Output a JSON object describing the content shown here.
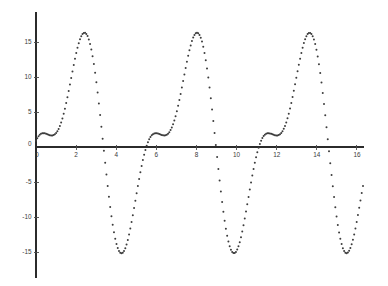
{
  "figure": {
    "title": "",
    "background_color": "#ffffff",
    "axis_color": "#2b2b2b",
    "marker_color": "#3c3c3c",
    "marker_style": "dot",
    "marker_size_px": 1.0
  },
  "geometry": {
    "origin_x_px": 36,
    "origin_y_px": 147,
    "px_per_x_unit": 20.06,
    "px_per_y_unit": 7.0,
    "x_axis_left_px": 36,
    "x_axis_right_px": 364,
    "y_axis_top_px": 12,
    "y_axis_bottom_px": 278
  },
  "chart_data": {
    "type": "scatter",
    "title": "",
    "xlabel": "",
    "ylabel": "",
    "xlim": [
      0,
      16.4
    ],
    "ylim": [
      -18.8,
      19.0
    ],
    "grid": false,
    "legend": "none",
    "xticks": [
      0,
      2,
      4,
      6,
      8,
      10,
      12,
      14,
      16
    ],
    "xticklabels": [
      "0",
      "2",
      "4",
      "6",
      "8",
      "10",
      "12",
      "14",
      "16"
    ],
    "yticks": [
      -15,
      -10,
      -5,
      0,
      5,
      10,
      15
    ],
    "yticklabels": [
      "-15",
      "-10",
      "-5",
      "0",
      "5",
      "10",
      "15"
    ],
    "series": [
      {
        "name": "signal",
        "color": "#3c3c3c",
        "marker": "dot",
        "sample_count": 260,
        "x_start": 0.0,
        "x_end": 16.3,
        "formula": "11.8*sin(1.12*x - 0.55) + 6.4*sin(2.24*x + 1.9) + 1.0",
        "annotations": {
          "start_value": 8.0,
          "local_min_near_x_0_5": 6.3,
          "peak_1": {
            "x": 2.35,
            "y": 18.1
          },
          "trough_1": {
            "x": 5.6,
            "y": -16.8
          },
          "peak_2": {
            "x": 8.7,
            "y": 17.6
          },
          "trough_2": {
            "x": 12.45,
            "y": -16.8
          },
          "peak_3": {
            "x": 15.05,
            "y": 17.0
          },
          "end_value": 9.0
        }
      }
    ]
  }
}
